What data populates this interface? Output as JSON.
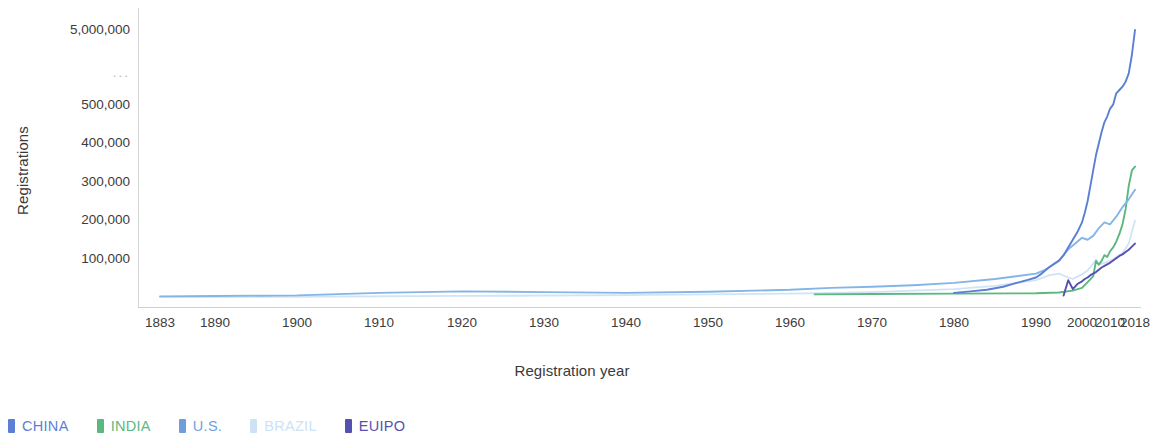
{
  "chart_data": {
    "type": "line",
    "title": "",
    "xlabel": "Registration year",
    "ylabel": "Registrations",
    "grid": false,
    "legend_position": "bottom-left",
    "y_axis_note": "broken scale: linear 0-500,000 then gap (...) to 5,000,000",
    "yticks": [
      {
        "label": "5,000,000",
        "value": 5000000,
        "y_px": 30
      },
      {
        "label": "...",
        "value": null,
        "y_px": 73
      },
      {
        "label": "500,000",
        "value": 500000,
        "y_px": 105
      },
      {
        "label": "400,000",
        "value": 400000,
        "y_px": 143
      },
      {
        "label": "300,000",
        "value": 300000,
        "y_px": 182
      },
      {
        "label": "200,000",
        "value": 200000,
        "y_px": 220
      },
      {
        "label": "100,000",
        "value": 100000,
        "y_px": 259
      }
    ],
    "xticks": [
      {
        "label": "1883",
        "value": 1883,
        "x_px": 160
      },
      {
        "label": "1890",
        "value": 1890,
        "x_px": 215
      },
      {
        "label": "1900",
        "value": 1900,
        "x_px": 297
      },
      {
        "label": "1910",
        "value": 1910,
        "x_px": 379
      },
      {
        "label": "1920",
        "value": 1920,
        "x_px": 462
      },
      {
        "label": "1930",
        "value": 1930,
        "x_px": 544
      },
      {
        "label": "1940",
        "value": 1940,
        "x_px": 626
      },
      {
        "label": "1950",
        "value": 1950,
        "x_px": 708
      },
      {
        "label": "1960",
        "value": 1960,
        "x_px": 790
      },
      {
        "label": "1970",
        "value": 1970,
        "x_px": 872
      },
      {
        "label": "1980",
        "value": 1980,
        "x_px": 954
      },
      {
        "label": "1990",
        "value": 1990,
        "x_px": 1036
      },
      {
        "label": "2000",
        "value": 2000,
        "x_px": 1082
      },
      {
        "label": "2010",
        "value": 2010,
        "x_px": 1110
      },
      {
        "label": "2018",
        "value": 2018,
        "x_px": 1135
      }
    ],
    "xlim": [
      1883,
      2018
    ],
    "ylim": [
      0,
      5000000
    ],
    "series": [
      {
        "name": "CHINA",
        "color": "#5b7fd4",
        "x": [
          1980,
          1982,
          1984,
          1985,
          1986,
          1987,
          1988,
          1989,
          1990,
          1991,
          1992,
          1993,
          1994,
          1995,
          1996,
          1997,
          1998,
          1999,
          2000,
          2001,
          2002,
          2003,
          2004,
          2005,
          2006,
          2007,
          2008,
          2009,
          2010,
          2011,
          2012,
          2013,
          2014,
          2015,
          2016,
          2017,
          2018
        ],
        "values": [
          12000,
          16000,
          20000,
          24000,
          28000,
          34000,
          40000,
          46000,
          52000,
          60000,
          70000,
          80000,
          88000,
          96000,
          110000,
          130000,
          150000,
          170000,
          195000,
          220000,
          250000,
          290000,
          330000,
          370000,
          400000,
          430000,
          455000,
          470000,
          490000,
          520000,
          1200000,
          1400000,
          1600000,
          1900000,
          2400000,
          3500000,
          5000000
        ]
      },
      {
        "name": "INDIA",
        "color": "#5cb87f",
        "x": [
          1963,
          1970,
          1980,
          1990,
          1995,
          1998,
          2000,
          2002,
          2004,
          2005,
          2006,
          2007,
          2008,
          2009,
          2010,
          2011,
          2012,
          2013,
          2014,
          2015,
          2016,
          2017,
          2018
        ],
        "values": [
          8000,
          9000,
          10000,
          11000,
          13000,
          18000,
          25000,
          40000,
          55000,
          95000,
          85000,
          95000,
          110000,
          105000,
          120000,
          130000,
          145000,
          165000,
          190000,
          230000,
          290000,
          330000,
          340000
        ]
      },
      {
        "name": "U.S.",
        "color": "#85b5e5",
        "x": [
          1883,
          1890,
          1900,
          1910,
          1920,
          1930,
          1940,
          1950,
          1960,
          1965,
          1970,
          1975,
          1980,
          1985,
          1990,
          1992,
          1995,
          1997,
          1998,
          2000,
          2002,
          2004,
          2006,
          2008,
          2010,
          2012,
          2014,
          2016,
          2018
        ],
        "values": [
          3000,
          4000,
          5500,
          12000,
          16000,
          14000,
          12000,
          15000,
          20000,
          25000,
          28000,
          32000,
          38000,
          48000,
          62000,
          72000,
          95000,
          125000,
          135000,
          155000,
          150000,
          160000,
          180000,
          195000,
          190000,
          210000,
          235000,
          255000,
          280000
        ]
      },
      {
        "name": "BRAZIL",
        "color": "#cde3f5",
        "x": [
          1883,
          1900,
          1920,
          1940,
          1960,
          1970,
          1980,
          1985,
          1990,
          1993,
          1995,
          1997,
          1998,
          2000,
          2002,
          2004,
          2005,
          2006,
          2008,
          2010,
          2012,
          2014,
          2016,
          2018
        ],
        "values": [
          1000,
          2000,
          4000,
          6000,
          10000,
          14000,
          22000,
          30000,
          45000,
          58000,
          62000,
          52000,
          48000,
          60000,
          70000,
          88000,
          98000,
          85000,
          90000,
          95000,
          105000,
          115000,
          140000,
          200000
        ]
      },
      {
        "name": "EUIPO",
        "color": "#5650b0",
        "x": [
          1996,
          1997,
          1998,
          1999,
          2000,
          2001,
          2002,
          2003,
          2004,
          2005,
          2006,
          2007,
          2008,
          2009,
          2010,
          2011,
          2012,
          2013,
          2014,
          2015,
          2016,
          2017,
          2018
        ],
        "values": [
          5000,
          45000,
          22000,
          35000,
          42000,
          48000,
          52000,
          58000,
          62000,
          66000,
          72000,
          78000,
          82000,
          86000,
          90000,
          96000,
          102000,
          108000,
          112000,
          118000,
          124000,
          132000,
          140000
        ]
      }
    ]
  },
  "legend": {
    "items": [
      {
        "label": "CHINA",
        "color": "#5b7fd4"
      },
      {
        "label": "INDIA",
        "color": "#5cb87f"
      },
      {
        "label": "U.S.",
        "color": "#6f9fdb"
      },
      {
        "label": "BRAZIL",
        "color": "#cde3f5"
      },
      {
        "label": "EUIPO",
        "color": "#5650b0"
      }
    ]
  }
}
